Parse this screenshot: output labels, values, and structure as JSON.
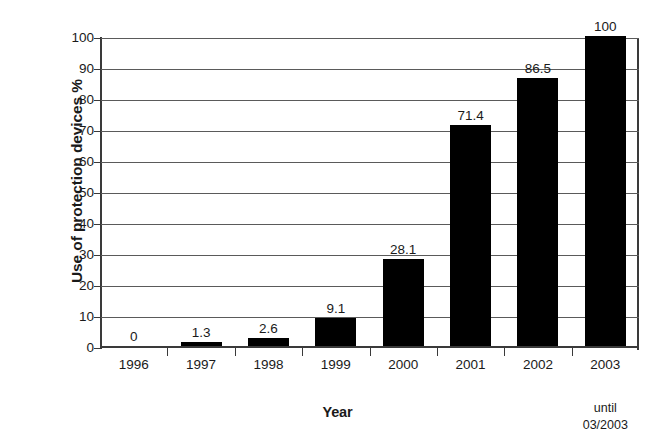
{
  "chart_data": {
    "type": "bar",
    "title": "",
    "subtitle": "",
    "xlabel": "Year",
    "ylabel": "Use of protection devices %",
    "categories": [
      "1996",
      "1997",
      "1998",
      "1999",
      "2000",
      "2001",
      "2002",
      "2003"
    ],
    "values": [
      0,
      1.3,
      2.6,
      9.1,
      28.1,
      71.4,
      86.5,
      100
    ],
    "value_labels": [
      "0",
      "1.3",
      "2.6",
      "9.1",
      "28.1",
      "71.4",
      "86.5",
      "100"
    ],
    "ylim": [
      0,
      100
    ],
    "ytick_labels": [
      "0",
      "10",
      "20",
      "30",
      "40",
      "50",
      "60",
      "70",
      "80",
      "90",
      "100"
    ],
    "ytick_values": [
      0,
      10,
      20,
      30,
      40,
      50,
      60,
      70,
      80,
      90,
      100
    ],
    "grid": "horizontal",
    "legend": "none",
    "bar_color": "#000000",
    "grid_color": "#5a5a5a",
    "axis_color": "#3a3a3a",
    "annotations": [
      {
        "name": "until-note",
        "attached_to_category": "2003",
        "line1": "until",
        "line2": "03/2003"
      }
    ]
  }
}
